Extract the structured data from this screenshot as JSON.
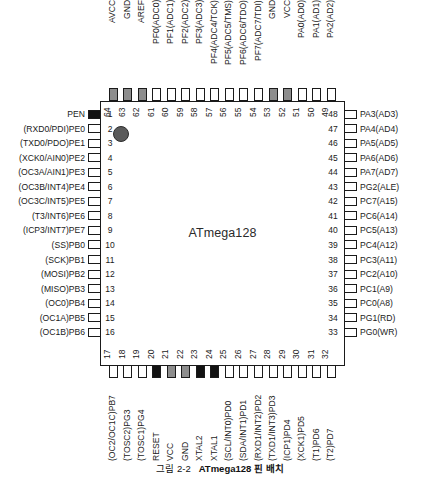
{
  "figure": {
    "chip_name": "ATmega128",
    "caption_number": "그림 2-2",
    "caption_title": "ATmega128 핀 배치",
    "package": "64-pin TQFP",
    "colors": {
      "outline": "#1a1a1a",
      "pin_fill_default": "#ffffff",
      "pin_fill_power": "#8d8d8d",
      "pin_fill_special": "#121212",
      "pin1_marker": "#5a5a5a",
      "background": "#ffffff"
    }
  },
  "pins": {
    "left": [
      {
        "number": "1",
        "label": "PEN",
        "fill": "black"
      },
      {
        "number": "2",
        "label": "(RXD0/PDI)PE0",
        "fill": "white"
      },
      {
        "number": "3",
        "label": "(TXD0/PDO)PE1",
        "fill": "white"
      },
      {
        "number": "4",
        "label": "(XCK0/AIN0)PE2",
        "fill": "white"
      },
      {
        "number": "5",
        "label": "(OC3A/AIN1)PE3",
        "fill": "white"
      },
      {
        "number": "6",
        "label": "(OC3B/INT4)PE4",
        "fill": "white"
      },
      {
        "number": "7",
        "label": "(OC3C/INT5)PE5",
        "fill": "white"
      },
      {
        "number": "8",
        "label": "(T3/INT6)PE6",
        "fill": "white"
      },
      {
        "number": "9",
        "label": "(ICP3/INT7)PE7",
        "fill": "white"
      },
      {
        "number": "10",
        "label": "(SS)PB0",
        "fill": "white"
      },
      {
        "number": "11",
        "label": "(SCK)PB1",
        "fill": "white"
      },
      {
        "number": "12",
        "label": "(MOSI)PB2",
        "fill": "white"
      },
      {
        "number": "13",
        "label": "(MISO)PB3",
        "fill": "white"
      },
      {
        "number": "14",
        "label": "(OC0)PB4",
        "fill": "white"
      },
      {
        "number": "15",
        "label": "(OC1A)PB5",
        "fill": "white"
      },
      {
        "number": "16",
        "label": "(OC1B)PB6",
        "fill": "white"
      }
    ],
    "bottom": [
      {
        "number": "17",
        "label": "(OC2/OC1C)PB7",
        "fill": "white"
      },
      {
        "number": "18",
        "label": "(TOSC2)PG3",
        "fill": "white"
      },
      {
        "number": "19",
        "label": "(TOSC1)PG4",
        "fill": "white"
      },
      {
        "number": "20",
        "label": "RESET",
        "fill": "black"
      },
      {
        "number": "21",
        "label": "VCC",
        "fill": "gray"
      },
      {
        "number": "22",
        "label": "GND",
        "fill": "gray"
      },
      {
        "number": "23",
        "label": "XTAL2",
        "fill": "black"
      },
      {
        "number": "24",
        "label": "XTAL1",
        "fill": "black"
      },
      {
        "number": "25",
        "label": "(SCL/INT0)PD0",
        "fill": "white"
      },
      {
        "number": "26",
        "label": "(SDA/INT1)PD1",
        "fill": "white"
      },
      {
        "number": "27",
        "label": "(RXD1/INT2)PD2",
        "fill": "white"
      },
      {
        "number": "28",
        "label": "(TXD1/INT3)PD3",
        "fill": "white"
      },
      {
        "number": "29",
        "label": "(ICP1)PD4",
        "fill": "white"
      },
      {
        "number": "30",
        "label": "(XCK1)PD5",
        "fill": "white"
      },
      {
        "number": "31",
        "label": "(T1)PD6",
        "fill": "white"
      },
      {
        "number": "32",
        "label": "(T2)PD7",
        "fill": "white"
      }
    ],
    "right": [
      {
        "number": "33",
        "label": "PG0(WR)",
        "fill": "white"
      },
      {
        "number": "34",
        "label": "PG1(RD)",
        "fill": "white"
      },
      {
        "number": "35",
        "label": "PC0(A8)",
        "fill": "white"
      },
      {
        "number": "36",
        "label": "PC1(A9)",
        "fill": "white"
      },
      {
        "number": "37",
        "label": "PC2(A10)",
        "fill": "white"
      },
      {
        "number": "38",
        "label": "PC3(A11)",
        "fill": "white"
      },
      {
        "number": "39",
        "label": "PC4(A12)",
        "fill": "white"
      },
      {
        "number": "40",
        "label": "PC5(A13)",
        "fill": "white"
      },
      {
        "number": "41",
        "label": "PC6(A14)",
        "fill": "white"
      },
      {
        "number": "42",
        "label": "PC7(A15)",
        "fill": "white"
      },
      {
        "number": "43",
        "label": "PG2(ALE)",
        "fill": "white"
      },
      {
        "number": "44",
        "label": "PA7(AD7)",
        "fill": "white"
      },
      {
        "number": "45",
        "label": "PA6(AD6)",
        "fill": "white"
      },
      {
        "number": "46",
        "label": "PA5(AD5)",
        "fill": "white"
      },
      {
        "number": "47",
        "label": "PA4(AD4)",
        "fill": "white"
      },
      {
        "number": "48",
        "label": "PA3(AD3)",
        "fill": "white"
      }
    ],
    "top": [
      {
        "number": "49",
        "label": "PA2(AD2)",
        "fill": "white"
      },
      {
        "number": "50",
        "label": "PA1(AD1)",
        "fill": "white"
      },
      {
        "number": "51",
        "label": "PA0(AD0)",
        "fill": "white"
      },
      {
        "number": "52",
        "label": "VCC",
        "fill": "gray"
      },
      {
        "number": "53",
        "label": "GND",
        "fill": "gray"
      },
      {
        "number": "54",
        "label": "PF7(ADC7/TDI)",
        "fill": "white"
      },
      {
        "number": "55",
        "label": "PF6(ADC6/TDO)",
        "fill": "white"
      },
      {
        "number": "56",
        "label": "PF5(ADC5/TMS)",
        "fill": "white"
      },
      {
        "number": "57",
        "label": "PF4(ADC4/TCK)",
        "fill": "white"
      },
      {
        "number": "58",
        "label": "PF3(ADC3)",
        "fill": "white"
      },
      {
        "number": "59",
        "label": "PF2(ADC2)",
        "fill": "white"
      },
      {
        "number": "60",
        "label": "PF1(ADC1)",
        "fill": "white"
      },
      {
        "number": "61",
        "label": "PF0(ADC0)",
        "fill": "white"
      },
      {
        "number": "62",
        "label": "AREF",
        "fill": "gray"
      },
      {
        "number": "63",
        "label": "GND",
        "fill": "gray"
      },
      {
        "number": "64",
        "label": "AVCC",
        "fill": "gray"
      }
    ]
  }
}
